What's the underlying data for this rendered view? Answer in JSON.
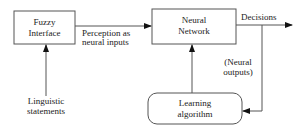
{
  "diagram": {
    "nodes": {
      "fuzzy_interface": {
        "lines": [
          "Fuzzy",
          "Interface"
        ],
        "shape": "rectangle"
      },
      "neural_network": {
        "lines": [
          "Neural",
          "Network"
        ],
        "shape": "rectangle"
      },
      "learning_algorithm": {
        "lines": [
          "Learning",
          "algorithm"
        ],
        "shape": "rounded-rectangle"
      }
    },
    "labels": {
      "perception": [
        "Perception as",
        "neural inputs"
      ],
      "decisions": "Decisions",
      "neural_outputs": [
        "(Neural",
        "outputs)"
      ],
      "linguistic": [
        "Linguistic",
        "statements"
      ]
    },
    "edges": [
      {
        "from": "linguistic_statements",
        "to": "fuzzy_interface"
      },
      {
        "from": "fuzzy_interface",
        "to": "neural_network",
        "label": "Perception as neural inputs"
      },
      {
        "from": "neural_network",
        "to": "output",
        "label": "Decisions"
      },
      {
        "from": "neural_network",
        "to": "learning_algorithm",
        "label": "(Neural outputs)"
      },
      {
        "from": "learning_algorithm",
        "to": "neural_network"
      }
    ],
    "colors": {
      "stroke": "#555555",
      "text": "#222222"
    }
  }
}
